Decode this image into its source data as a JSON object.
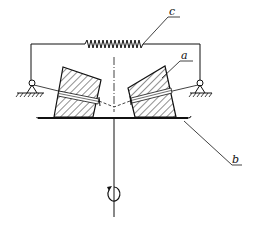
{
  "diagram": {
    "type": "mechanical schematic",
    "labels": {
      "spring": "c",
      "block": "a",
      "plate": "b"
    },
    "components": [
      {
        "id": "c",
        "name": "spring"
      },
      {
        "id": "a",
        "name": "hatched block (weight)"
      },
      {
        "id": "b",
        "name": "rotating plate"
      }
    ],
    "symbols": {
      "rotation": "rotation-arrow-icon",
      "ground": "ground-hatch-icon",
      "pivot": "pivot-icon",
      "centerline": "dash-dot axis"
    },
    "colors": {
      "stroke": "#111111",
      "background": "#ffffff"
    }
  }
}
